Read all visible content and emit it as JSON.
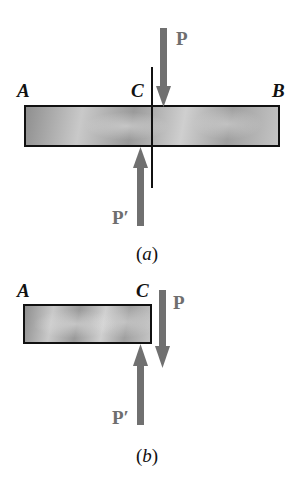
{
  "figure_a": {
    "caption_open": "(",
    "caption_letter": "a",
    "caption_close": ")",
    "labels": {
      "A": "A",
      "C": "C",
      "B": "B"
    },
    "forces": {
      "P": "P",
      "P_prime": "P′"
    }
  },
  "figure_b": {
    "caption_open": "(",
    "caption_letter": "b",
    "caption_close": ")",
    "labels": {
      "A": "A",
      "C": "C"
    },
    "forces": {
      "P": "P",
      "P_prime": "P′"
    }
  },
  "colors": {
    "arrow": "#707070",
    "outline": "#111111",
    "bar_light": "#cfcfcf",
    "bar_dark": "#8f8f8f"
  }
}
